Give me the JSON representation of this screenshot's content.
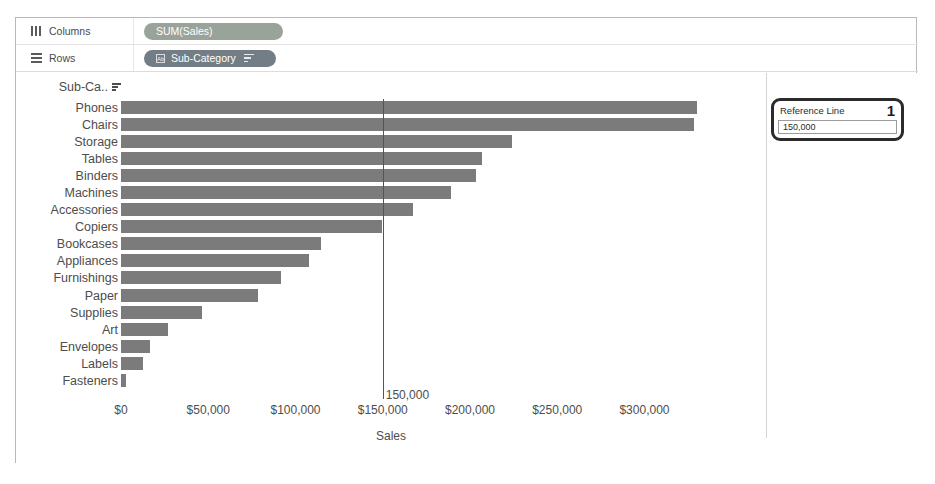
{
  "shelves": {
    "columns": {
      "label": "Columns",
      "icon": "columns-icon",
      "pill": "SUM(Sales)"
    },
    "rows": {
      "label": "Rows",
      "icon": "rows-icon",
      "pill": "Sub-Category",
      "pill_glyph": "Ab"
    }
  },
  "reference_card": {
    "title": "Reference Line",
    "badge": "1",
    "value": "150,000"
  },
  "chart_data": {
    "type": "bar",
    "orientation": "horizontal",
    "title": "",
    "row_header": "Sub-Ca..",
    "xlabel": "Sales",
    "ylabel": "",
    "xlim": [
      0,
      345000
    ],
    "xticks": [
      0,
      50000,
      100000,
      150000,
      200000,
      250000,
      300000
    ],
    "xticklabels": [
      "$0",
      "$50,000",
      "$100,000",
      "$150,000",
      "$200,000",
      "$250,000",
      "$300,000"
    ],
    "grid": false,
    "legend": "none",
    "bar_color": "#7b7b7b",
    "categories": [
      "Phones",
      "Chairs",
      "Storage",
      "Tables",
      "Binders",
      "Machines",
      "Accessories",
      "Copiers",
      "Bookcases",
      "Appliances",
      "Furnishings",
      "Paper",
      "Supplies",
      "Art",
      "Envelopes",
      "Labels",
      "Fasteners"
    ],
    "values": [
      330007,
      328449,
      223844,
      206966,
      203413,
      189239,
      167380,
      149528,
      114880,
      107532,
      91705,
      78479,
      46674,
      27119,
      16476,
      12486,
      3024
    ],
    "reference_line": {
      "value": 150000,
      "label": "150,000",
      "axis": "x",
      "color": "#555555"
    }
  }
}
